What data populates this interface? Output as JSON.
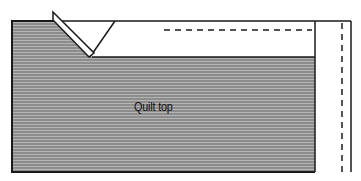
{
  "diagram": {
    "type": "sewing-illustration",
    "labels": {
      "quilt_top": "Quilt top"
    },
    "colors": {
      "fabric_fill": "#8c8c8c",
      "fabric_stripe": "#b4b4b4",
      "outline": "#1a1a1a",
      "background": "#ffffff"
    },
    "elements": [
      "quilt top fabric (striped gray)",
      "folded binding strip at mitered corner",
      "white binding band along top edge",
      "dashed stitching line along top",
      "white binding band along right edge",
      "dashed stitching line along right"
    ]
  }
}
